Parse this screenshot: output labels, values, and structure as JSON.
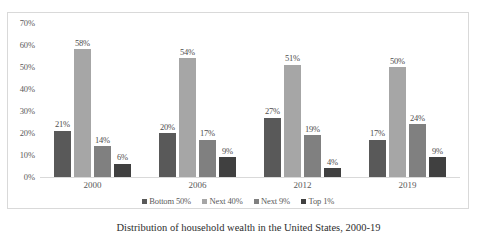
{
  "caption": "Distribution of household wealth in the United States, 2000-19",
  "legend": {
    "items": [
      {
        "label": "Bottom 50%",
        "color": "#595959"
      },
      {
        "label": "Next 40%",
        "color": "#a6a6a6"
      },
      {
        "label": "Next 9%",
        "color": "#808080"
      },
      {
        "label": "Top 1%",
        "color": "#404040"
      }
    ]
  },
  "axes": {
    "y_ticks": [
      "0%",
      "10%",
      "20%",
      "30%",
      "40%",
      "50%",
      "60%",
      "70%"
    ],
    "x_ticks": [
      "2000",
      "2006",
      "2012",
      "2019"
    ]
  },
  "chart_data": {
    "type": "bar",
    "title": "",
    "xlabel": "",
    "ylabel": "",
    "ylim": [
      0,
      70
    ],
    "ytick_step": 10,
    "grid": false,
    "legend_position": "bottom",
    "categories": [
      "2000",
      "2006",
      "2012",
      "2019"
    ],
    "series": [
      {
        "name": "Bottom 50%",
        "color": "#595959",
        "values": [
          21,
          20,
          27,
          17
        ],
        "labels": [
          "21%",
          "20%",
          "27%",
          "17%"
        ]
      },
      {
        "name": "Next 40%",
        "color": "#a6a6a6",
        "values": [
          58,
          54,
          51,
          50
        ],
        "labels": [
          "58%",
          "54%",
          "51%",
          "50%"
        ]
      },
      {
        "name": "Next 9%",
        "color": "#808080",
        "values": [
          14,
          17,
          19,
          24
        ],
        "labels": [
          "14%",
          "17%",
          "19%",
          "24%"
        ]
      },
      {
        "name": "Top 1%",
        "color": "#404040",
        "values": [
          6,
          9,
          4,
          9
        ],
        "labels": [
          "6%",
          "9%",
          "4%",
          "9%"
        ]
      }
    ]
  }
}
